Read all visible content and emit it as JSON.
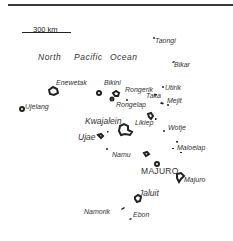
{
  "map": {
    "title_rule": true,
    "scale": {
      "label": "300 km"
    },
    "ocean_label": {
      "words": [
        "North",
        "Pacific",
        "Ocean"
      ]
    },
    "labels": {
      "taongi": "Taongi",
      "bikar": "Bikar",
      "enewetak": "Enewetak",
      "bikini": "Bikini",
      "rongerik": "Rongerik",
      "utirik": "Utirik",
      "taka": "Taka",
      "mejit": "Mejit",
      "ujelang": "Ujelang",
      "rongelap": "Rongelap",
      "kwajalein": "Kwajalein",
      "likiep": "Likiep",
      "wotje": "Wotje",
      "ujae": "Ujae",
      "maloelap": "Maloelap",
      "namu": "Namu",
      "majuro_capital": "MAJURO",
      "majuro": "Majuro",
      "jaluit": "Jaluit",
      "namorik": "Namorik",
      "ebon": "Ebon"
    },
    "colors": {
      "ink": "#222222",
      "background": "#ffffff"
    }
  }
}
